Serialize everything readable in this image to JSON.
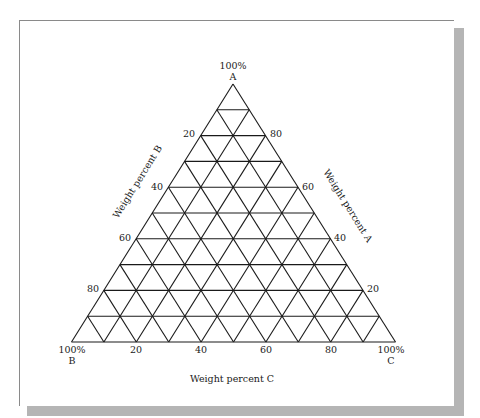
{
  "diagram": {
    "type": "ternary",
    "vertices": {
      "top": {
        "percent": "100%",
        "name": "A"
      },
      "bottom_left": {
        "percent": "100%",
        "name": "B"
      },
      "bottom_right": {
        "percent": "100%",
        "name": "C"
      }
    },
    "axes": {
      "left": {
        "title": "Weight percent B",
        "ticks": [
          "20",
          "40",
          "60",
          "80"
        ]
      },
      "right": {
        "title": "Weight percent A",
        "ticks": [
          "80",
          "60",
          "40",
          "20"
        ]
      },
      "bottom": {
        "title": "Weight percent C",
        "ticks": [
          "20",
          "40",
          "60",
          "80"
        ]
      }
    },
    "grid_divisions": 10,
    "line_color": "#1a1a1a"
  }
}
